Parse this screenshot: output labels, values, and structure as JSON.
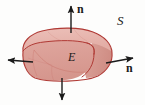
{
  "figure": {
    "background_color": "#fdfdfc",
    "labels": {
      "normal_top": "n",
      "normal_right": "n",
      "surface": "S",
      "region": "E"
    },
    "colors": {
      "solid_top_face": "#e8b5ae",
      "solid_front_face": "#dda49c",
      "solid_right_face": "#d89a92",
      "outline": "#b03a35",
      "interior_line": "#c9766e",
      "arrow": "#1a1a1a",
      "text": "#1a1a1a"
    },
    "arrows": [
      {
        "name": "normal-up",
        "direction": "up",
        "labeled": true
      },
      {
        "name": "normal-right",
        "direction": "right",
        "labeled": true
      },
      {
        "name": "normal-left",
        "direction": "left",
        "labeled": false
      },
      {
        "name": "normal-down",
        "direction": "down",
        "labeled": false
      }
    ]
  }
}
